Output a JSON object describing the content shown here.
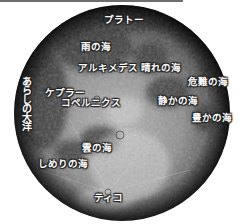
{
  "figure": {
    "title": "",
    "colors": {
      "background": "#ffffff",
      "top_bar": "#6e6e6e",
      "label_text": "#ffffff",
      "label_outline": "#222222"
    }
  },
  "labels": [
    {
      "id": "plato",
      "text": "プラトー",
      "x": 104,
      "y": 15,
      "kind": "crater"
    },
    {
      "id": "mare-imbrium",
      "text": "雨の海",
      "x": 81,
      "y": 42,
      "kind": "mare"
    },
    {
      "id": "archimedes",
      "text": "アルキメデス",
      "x": 78,
      "y": 63,
      "kind": "crater"
    },
    {
      "id": "mare-serenitatis",
      "text": "晴れの海",
      "x": 141,
      "y": 63,
      "kind": "mare"
    },
    {
      "id": "mare-crisium",
      "text": "危難の海",
      "x": 188,
      "y": 77,
      "kind": "mare"
    },
    {
      "id": "kepler",
      "text": "ケプラー",
      "x": 45,
      "y": 88,
      "kind": "crater"
    },
    {
      "id": "copernicus",
      "text": "コペルニクス",
      "x": 61,
      "y": 98,
      "kind": "crater"
    },
    {
      "id": "mare-tranquillitatis",
      "text": "静かの海",
      "x": 158,
      "y": 96,
      "kind": "mare"
    },
    {
      "id": "mare-fecunditatis",
      "text": "豊かの海",
      "x": 192,
      "y": 113,
      "kind": "mare"
    },
    {
      "id": "mare-nubium",
      "text": "雲の海",
      "x": 82,
      "y": 143,
      "kind": "mare"
    },
    {
      "id": "mare-humorum",
      "text": "しめりの海",
      "x": 38,
      "y": 159,
      "kind": "mare"
    },
    {
      "id": "tycho",
      "text": "ティコ",
      "x": 94,
      "y": 193,
      "kind": "crater"
    }
  ],
  "vertical_labels": [
    {
      "id": "oceanus-procellarum",
      "text": "あらしの大洋",
      "x": 20,
      "y": 76,
      "kind": "ocean"
    }
  ]
}
